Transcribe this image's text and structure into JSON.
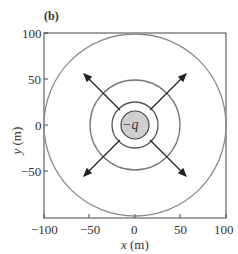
{
  "panel_label": "(b)",
  "charge_label": "−q",
  "axes": {
    "xlabel_var": "x",
    "xlabel_unit": " (m)",
    "ylabel_var": "y",
    "ylabel_unit": " (m)",
    "xticks": [
      "−100",
      "−50",
      "0",
      "50",
      "100"
    ],
    "yticks": [
      "100",
      "50",
      "0",
      "−50"
    ],
    "range": [
      -100,
      100
    ]
  },
  "figure": {
    "circles_radii_m": [
      15,
      25,
      50,
      100
    ],
    "arrows": "four field arrows pointing radially outward along diagonals",
    "colors": {
      "circle": "#8a8a8a",
      "arrow": "#222222",
      "charge_fill": "#cfcfcf",
      "frame": "#444444"
    }
  }
}
